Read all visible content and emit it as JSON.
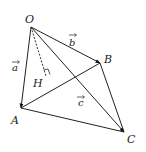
{
  "diagram": {
    "type": "tetrahedron-vectors",
    "points": {
      "O": {
        "label": "O",
        "x": 31,
        "y": 27,
        "lx": 25,
        "ly": 23
      },
      "A": {
        "label": "A",
        "x": 21,
        "y": 108,
        "lx": 11,
        "ly": 124
      },
      "B": {
        "label": "B",
        "x": 100,
        "y": 63,
        "lx": 104,
        "ly": 63
      },
      "C": {
        "label": "C",
        "x": 124,
        "y": 132,
        "lx": 127,
        "ly": 143
      },
      "H": {
        "label": "H",
        "x": 46,
        "y": 76,
        "lx": 33,
        "ly": 87
      }
    },
    "vectors": [
      {
        "name": "a",
        "label": "a",
        "from": "O",
        "to": "A",
        "lx": 12,
        "ly": 71
      },
      {
        "name": "b",
        "label": "b",
        "from": "O",
        "to": "B",
        "lx": 69,
        "ly": 46
      },
      {
        "name": "c",
        "label": "c",
        "from": "O",
        "to": "C",
        "lx": 78,
        "ly": 106
      }
    ],
    "edges": [
      [
        "A",
        "B"
      ],
      [
        "A",
        "C"
      ],
      [
        "B",
        "C"
      ]
    ],
    "dashed": [
      [
        "O",
        "H"
      ]
    ],
    "right_angle_at": "H"
  }
}
